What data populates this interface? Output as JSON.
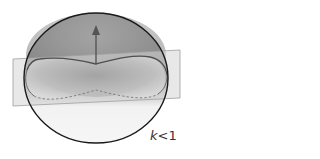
{
  "figure": {
    "label": {
      "variable": "k",
      "relation": "<1"
    },
    "colors": {
      "sphere_top": "#8e8e8e",
      "sphere_mid": "#9c9c9c",
      "sphere_bottom": "#f4f4f4",
      "sphere_outline": "#1a1a1a",
      "plane_fill": "#d4d4d4",
      "plane_edge": "#9a9a9a",
      "arrow": "#555555",
      "curve": "#5a5a5a"
    }
  }
}
